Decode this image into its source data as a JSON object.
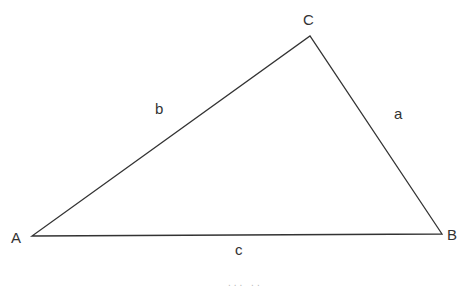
{
  "diagram": {
    "type": "triangle",
    "stroke_color": "#333333",
    "vertices": {
      "A": {
        "label": "A",
        "x": 32,
        "y": 236
      },
      "B": {
        "label": "B",
        "x": 442,
        "y": 234
      },
      "C": {
        "label": "C",
        "x": 310,
        "y": 36
      }
    },
    "sides": {
      "a": {
        "label": "a",
        "between": [
          "B",
          "C"
        ]
      },
      "b": {
        "label": "b",
        "between": [
          "A",
          "C"
        ]
      },
      "c": {
        "label": "c",
        "between": [
          "A",
          "B"
        ]
      }
    },
    "caption_partial": "... .."
  }
}
